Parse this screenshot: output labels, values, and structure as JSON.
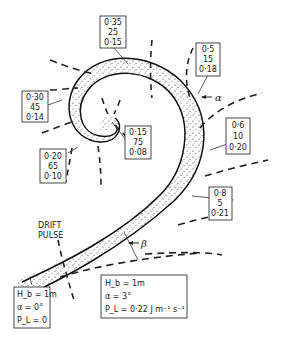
{
  "diagram": {
    "type": "longshore drift pulse along a spiral shoreline",
    "labels": {
      "drift_pulse_line1": "DRIFT",
      "drift_pulse_line2": "PULSE",
      "alpha": "α",
      "beta": "β"
    },
    "stations": [
      {
        "id": "box1",
        "values": [
          "0·35",
          "25",
          "0·15"
        ]
      },
      {
        "id": "box2",
        "values": [
          "0·5",
          "15",
          "0·18"
        ]
      },
      {
        "id": "box3",
        "values": [
          "0·30",
          "45",
          "0·14"
        ]
      },
      {
        "id": "box4",
        "values": [
          "0·15",
          "75",
          "0·08"
        ]
      },
      {
        "id": "box5",
        "values": [
          "0·6",
          "10",
          "0·20"
        ]
      },
      {
        "id": "box6",
        "values": [
          "0·20",
          "65",
          "0·10"
        ]
      },
      {
        "id": "box7",
        "values": [
          "0·8",
          "5",
          "0·21"
        ]
      }
    ],
    "legend_left": {
      "line1": "H_b = 1m",
      "line2": "α = 0°",
      "line3": "P_L = 0"
    },
    "legend_right": {
      "line1": "H_b = 1m",
      "line2": "α = 3°",
      "line3": "P_L = 0·22 J m⁻¹ s⁻¹"
    }
  }
}
